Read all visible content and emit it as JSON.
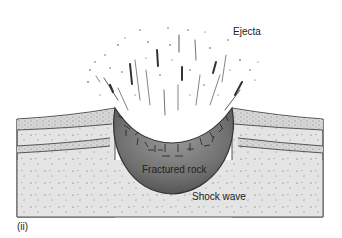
{
  "diagram": {
    "panel_label": "(ii)",
    "labels": {
      "ejecta": "Ejecta",
      "fractured_rock": "Fractured rock",
      "shock_wave": "Shock wave"
    },
    "colors": {
      "ground": "#e6e6e6",
      "layer_band": "#d9d9d9",
      "layer_line": "#555555",
      "crater_fill": "#7a7a7a",
      "crater_edge": "#3a3a3a",
      "ejecta": "#333333"
    }
  }
}
